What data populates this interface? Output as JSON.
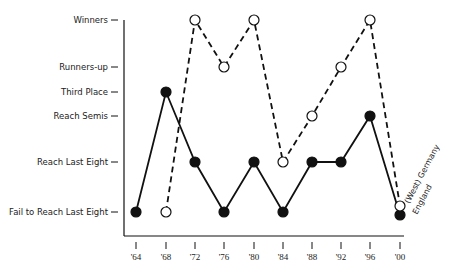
{
  "chart_data": {
    "type": "line",
    "title": "",
    "xlabel": "",
    "ylabel": "",
    "categories": [
      "'64",
      "'68",
      "'72",
      "'76",
      "'80",
      "'84",
      "'88",
      "'92",
      "'96",
      "'00"
    ],
    "y_levels": [
      "Fail to Reach Last Eight",
      "Reach Last Eight",
      "Reach Semis",
      "Third Place",
      "Runners-up",
      "Winners"
    ],
    "series": [
      {
        "name": "England",
        "style": "solid, filled markers",
        "values": [
          "Fail to Reach Last Eight",
          "Third Place",
          "Reach Last Eight",
          "Fail to Reach Last Eight",
          "Reach Last Eight",
          "Fail to Reach Last Eight",
          "Reach Last Eight",
          "Reach Last Eight",
          "Reach Semis",
          "Fail to Reach Last Eight"
        ]
      },
      {
        "name": "(West) Germany",
        "style": "dashed, open markers",
        "values": [
          null,
          "Fail to Reach Last Eight",
          "Winners",
          "Runners-up",
          "Winners",
          "Reach Last Eight",
          "Reach Semis",
          "Runners-up",
          "Winners",
          "Fail to Reach Last Eight"
        ]
      }
    ],
    "legend": [
      "(West) Germany",
      "England"
    ],
    "legend_position": "inline-right, rotated",
    "grid": false
  },
  "labels": {
    "series_germany": "(West) Germany",
    "series_england": "England"
  }
}
